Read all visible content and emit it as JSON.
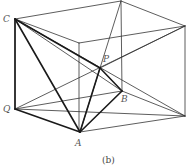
{
  "figure": {
    "caption": "(b)",
    "labels": {
      "C": "C",
      "P": "P",
      "B": "B",
      "Q": "Q",
      "A": "A"
    },
    "colors": {
      "line": "#222222",
      "label": "#555555"
    }
  }
}
